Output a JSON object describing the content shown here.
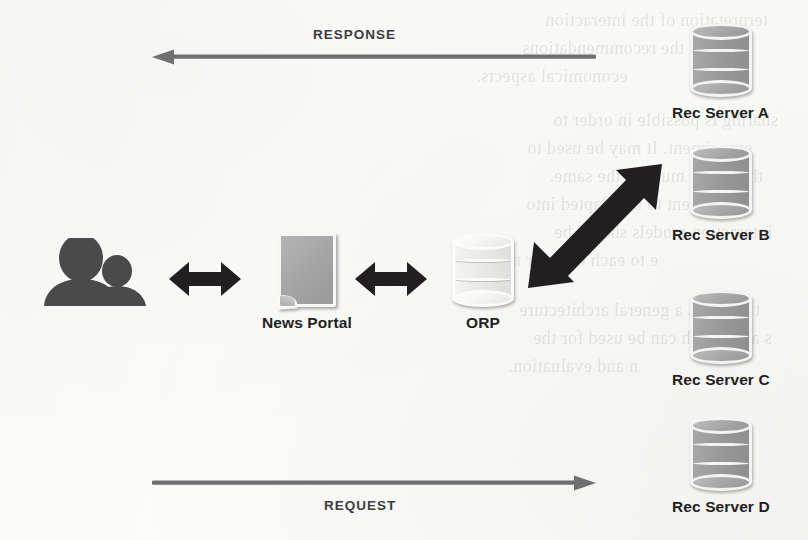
{
  "diagram": {
    "nodes": [
      {
        "id": "users",
        "label": "",
        "icon": "users-icon"
      },
      {
        "id": "news_portal",
        "label": "News Portal",
        "icon": "document-icon"
      },
      {
        "id": "orp",
        "label": "ORP",
        "icon": "database-icon"
      },
      {
        "id": "rec_server_a",
        "label": "Rec Server A",
        "icon": "database-icon"
      },
      {
        "id": "rec_server_b",
        "label": "Rec Server B",
        "icon": "database-icon"
      },
      {
        "id": "rec_server_c",
        "label": "Rec Server C",
        "icon": "database-icon"
      },
      {
        "id": "rec_server_d",
        "label": "Rec Server D",
        "icon": "database-icon"
      }
    ],
    "flows": [
      {
        "id": "response",
        "label": "RESPONSE",
        "direction": "left",
        "label_position": "above"
      },
      {
        "id": "request",
        "label": "REQUEST",
        "direction": "right",
        "label_position": "below"
      }
    ],
    "links": [
      {
        "id": "users-portal",
        "from": "users",
        "to": "news_portal",
        "style": "bidirectional-bold"
      },
      {
        "id": "portal-orp",
        "from": "news_portal",
        "to": "orp",
        "style": "bidirectional-bold"
      },
      {
        "id": "orp-server-b",
        "from": "orp",
        "to": "rec_server_b",
        "style": "bidirectional-bold-diagonal"
      }
    ],
    "colors": {
      "background": "#fbfbfa",
      "arrow_bold": "#231f20",
      "arrow_thin": "#6f6f6f",
      "label_text": "#231f20",
      "flow_label_text": "#3d3d3d",
      "db_dark_fill": "#9a9a9a",
      "db_light_fill": "#e9e9e6",
      "doc_fill": "#a4a4a4",
      "users_fill": "#4a4a4a"
    }
  },
  "background_ghost_text": [
    "terpretation of the interaction",
    "ation of the recommendations",
    "economical aspects.",
    "sharing is possible in order to",
    "experiment. It may be used to",
    "therefore, must be the same.",
    "sufficient to be adapted into",
    "interaction models should be",
    "e to each other or not.",
    "t presents a general architecture",
    "s and which can be used for the",
    "n and evaluation."
  ]
}
